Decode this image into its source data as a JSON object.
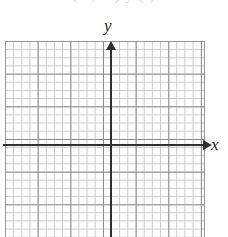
{
  "figure": {
    "kind": "blank-coordinate-grid",
    "top_clipped_text": "( 2, 0 )   y   ( )",
    "axis_labels": {
      "x": "x",
      "y": "y"
    },
    "colors": {
      "background": "#ffffff",
      "grid_minor": "#c9c9c9",
      "grid_major": "#8e8e8e",
      "grid_border": "#9a9a9a",
      "axis": "#2f2f2f",
      "label_text": "#2b2b2b"
    }
  },
  "chart_data": {
    "type": "scatter",
    "title": "",
    "xlabel": "x",
    "ylabel": "y",
    "series": [],
    "x": [],
    "values": [],
    "xlim": [
      -13,
      11
    ],
    "ylim": [
      -11,
      12
    ],
    "grid": true,
    "grid_minor_step": 1,
    "grid_major_step": 4,
    "legend": "none",
    "annotations": []
  }
}
